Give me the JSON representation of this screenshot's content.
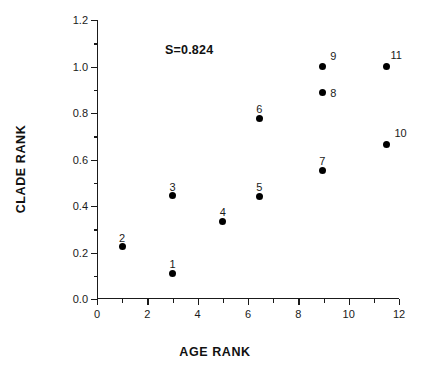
{
  "chart_data": {
    "type": "scatter",
    "title": "",
    "xlabel": "AGE RANK",
    "ylabel": "CLADE RANK",
    "xlim": [
      0,
      12
    ],
    "ylim": [
      0.0,
      1.2
    ],
    "grid": false,
    "legend": "none",
    "annotations": [
      {
        "text": "S=0.824",
        "x": 3.0,
        "y": 1.09
      }
    ],
    "x_ticks_major": [
      0,
      2,
      4,
      6,
      8,
      10,
      12
    ],
    "x_tick_labels": [
      "0",
      "2",
      "4",
      "6",
      "8",
      "10",
      "12"
    ],
    "x_ticks_minor": [
      1,
      3,
      5,
      7,
      9,
      11
    ],
    "y_ticks_major": [
      0.0,
      0.2,
      0.4,
      0.6,
      0.8,
      1.0,
      1.2
    ],
    "y_tick_labels": [
      "0.0",
      "0.2",
      "0.4",
      "0.6",
      "0.8",
      "1.0",
      "1.2"
    ],
    "y_ticks_minor": [
      0.1,
      0.3,
      0.5,
      0.7,
      0.9,
      1.1
    ],
    "marker_color": "#000000",
    "marker_shape": "filled-circle",
    "points": [
      {
        "label": "1",
        "x": 3.0,
        "y": 0.11,
        "label_dx": 0,
        "label_dy": -14
      },
      {
        "label": "2",
        "x": 1.0,
        "y": 0.225,
        "label_dx": 0,
        "label_dy": -14
      },
      {
        "label": "3",
        "x": 3.0,
        "y": 0.445,
        "label_dx": 0,
        "label_dy": -14
      },
      {
        "label": "4",
        "x": 5.0,
        "y": 0.335,
        "label_dx": 0,
        "label_dy": -14
      },
      {
        "label": "5",
        "x": 6.45,
        "y": 0.443,
        "label_dx": 0,
        "label_dy": -14
      },
      {
        "label": "6",
        "x": 6.45,
        "y": 0.778,
        "label_dx": 0,
        "label_dy": -14
      },
      {
        "label": "7",
        "x": 8.95,
        "y": 0.553,
        "label_dx": 0,
        "label_dy": -14
      },
      {
        "label": "8",
        "x": 8.95,
        "y": 0.89,
        "label_dx": 8,
        "label_dy": -4
      },
      {
        "label": "9",
        "x": 8.95,
        "y": 1.0,
        "label_dx": 8,
        "label_dy": -16
      },
      {
        "label": "10",
        "x": 11.5,
        "y": 0.665,
        "label_dx": 8,
        "label_dy": -16
      },
      {
        "label": "11",
        "x": 11.5,
        "y": 1.0,
        "label_dx": 4,
        "label_dy": -17
      }
    ]
  },
  "figure": {
    "background_color": "#ffffff",
    "axis_color": "#1a1a1a"
  }
}
